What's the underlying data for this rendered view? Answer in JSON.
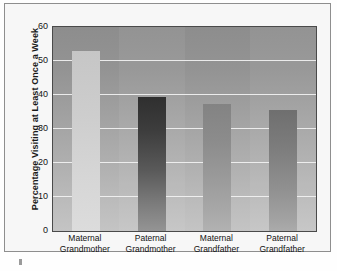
{
  "chart_data": {
    "type": "bar",
    "title": "",
    "subtitle": "",
    "xlabel": "",
    "ylabel": "Percentage Visiting at Least Once a Week",
    "categories": [
      "Maternal\nGrandmother",
      "Paternal\nGrandmother",
      "Maternal\nGrandfather",
      "Paternal\nGrandfather"
    ],
    "category_lines": [
      [
        "Maternal",
        "Grandmother"
      ],
      [
        "Paternal",
        "Grandmother"
      ],
      [
        "Maternal",
        "Grandfather"
      ],
      [
        "Paternal",
        "Grandfather"
      ]
    ],
    "values": [
      53,
      39.5,
      37.5,
      35.5
    ],
    "ylim": [
      0,
      60
    ],
    "ytick_labels": [
      "0",
      "10",
      "20",
      "30",
      "40",
      "50",
      "60"
    ],
    "ytick_values": [
      0,
      10,
      20,
      30,
      40,
      50,
      60
    ],
    "grid": "horizontal",
    "legend": "none",
    "bar_colors": [
      "#d2d2d2",
      "#3a3a3a",
      "#909090",
      "#7c7c7c"
    ],
    "plot_background": "#a0a0a0",
    "gridline_color": "#f2f2f2",
    "axis_color": "#4a4a4a",
    "text_color": "#121212"
  },
  "axis": {
    "y_title": "Percentage Visiting at Least Once a Week"
  }
}
